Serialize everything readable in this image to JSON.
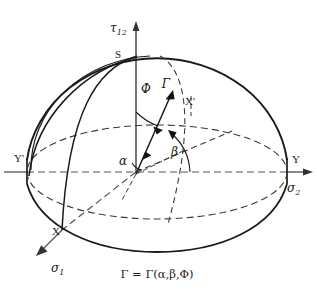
{
  "figure": {
    "title_caption": "Γ = Γ(α,β,Φ)",
    "background_color": "#ffffff",
    "line_color": "#1a1a1a",
    "description_type": "3d-hemisphere-failure-surface"
  },
  "axes": {
    "vertical": {
      "symbol": "τ",
      "subscript": "12",
      "name": "shear-stress-axis"
    },
    "horizontal_right": {
      "symbol": "σ",
      "subscript": "2",
      "name": "sigma-2-axis"
    },
    "oblique_lower_left": {
      "symbol": "σ",
      "subscript": "1",
      "name": "sigma-1-axis"
    }
  },
  "points": [
    {
      "label": "S",
      "name": "point-s-apex",
      "x": 124,
      "y": 54
    },
    {
      "label": "Y",
      "name": "point-y-right",
      "x": 287,
      "y": 159
    },
    {
      "label": "Y'",
      "name": "point-yprime-left",
      "x": 27,
      "y": 158
    },
    {
      "label": "X",
      "name": "point-x-front",
      "x": 62,
      "y": 230
    },
    {
      "label": "X'",
      "name": "point-xprime-rear",
      "x": 191,
      "y": 102
    }
  ],
  "vector": {
    "label": "Γ",
    "name": "gamma-vector",
    "origin_x": 139,
    "origin_y": 172,
    "tip_x": 172,
    "tip_y": 95
  },
  "angles": [
    {
      "label": "Φ",
      "name": "angle-phi",
      "x": 146,
      "y": 89,
      "meaning": "angle-from-tau12-axis"
    },
    {
      "label": "α",
      "name": "angle-alpha",
      "x": 122,
      "y": 160,
      "meaning": "angle-at-origin-left"
    },
    {
      "label": "β",
      "name": "angle-beta",
      "x": 175,
      "y": 152,
      "meaning": "angle-from-sigma2-axis"
    }
  ],
  "caption": {
    "text": "Γ = Γ(α,β,Φ)",
    "name": "figure-caption"
  }
}
